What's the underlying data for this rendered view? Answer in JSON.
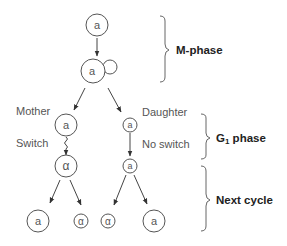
{
  "diagram": {
    "type": "yeast mating-type switching lineage",
    "cells": {
      "top": "a",
      "budding": "a",
      "mother": "a",
      "daughter": "a",
      "mother_after_switch": "α",
      "daughter_no_switch": "a",
      "gen3": [
        "a",
        "α",
        "α",
        "a"
      ]
    },
    "labels": {
      "mother": "Mother",
      "daughter": "Daughter",
      "switch": "Switch",
      "no_switch": "No switch"
    },
    "phases": {
      "m_phase": "M-phase",
      "g1_phase_main": "G",
      "g1_phase_sub": "1",
      "g1_phase_rest": " phase",
      "next_cycle": "Next cycle"
    }
  }
}
